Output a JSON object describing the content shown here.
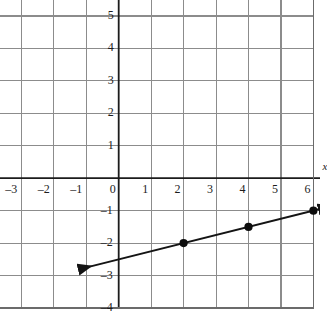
{
  "chart_data": {
    "type": "line",
    "title": "",
    "xlabel": "x",
    "ylabel": "y",
    "xlim": [
      -4,
      6.5
    ],
    "ylim": [
      -4,
      6.5
    ],
    "grid": true,
    "grid_step": 1,
    "legend": "none",
    "x_ticks": [
      -4,
      -3,
      -2,
      -1,
      0,
      1,
      2,
      3,
      4,
      5,
      6
    ],
    "y_ticks": [
      -4,
      -3,
      -2,
      -1,
      1,
      2,
      3,
      4,
      5,
      6
    ],
    "x_tick_labels": [
      "–4",
      "–3",
      "–2",
      "–1",
      "0",
      "1",
      "2",
      "3",
      "4",
      "5",
      "6"
    ],
    "y_tick_labels": [
      "–4",
      "–3",
      "–2",
      "–1",
      "1",
      "2",
      "3",
      "4",
      "5",
      "6"
    ],
    "series": [
      {
        "name": "line",
        "equation": "y = 0.25x - 2.5",
        "slope": 0.25,
        "intercept": -2.5,
        "x": [
          -1.2,
          6.2
        ],
        "y": [
          -2.8,
          -0.95
        ],
        "arrow_start": true,
        "arrow_end": true,
        "points": [
          {
            "x": 2,
            "y": -2
          },
          {
            "x": 4,
            "y": -1.5
          },
          {
            "x": 6,
            "y": -1
          }
        ]
      }
    ],
    "colors": {
      "grid": "#8c8c8c",
      "axis": "#1c1c1c",
      "line": "#141414",
      "point": "#0d0d0d",
      "background": "#ffffff",
      "label": "#1c1c1c"
    }
  },
  "axis_labels": {
    "x": "x",
    "y": "y"
  }
}
